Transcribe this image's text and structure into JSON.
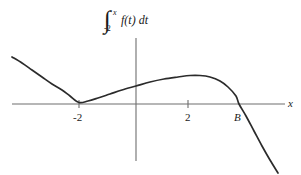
{
  "figure": {
    "title_expression": "integral from -2 to x of f(t) dt",
    "background_color": "#ffffff",
    "curve_color": "#2b2b2b",
    "axis_color": "#6e6e6e"
  },
  "title": {
    "integral_sign": "∫",
    "upper_limit": "x",
    "lower_limit": "-2",
    "integrand": "f(t)",
    "differential": "dt"
  },
  "axes": {
    "x_axis_label": "x",
    "x_axis_y_pixel": 104,
    "y_axis_x_pixel": 136,
    "ticks": [
      {
        "label": "-2",
        "x_pixel": 79
      },
      {
        "label": "2",
        "x_pixel": 188
      }
    ],
    "marked_points": [
      {
        "label": "B",
        "x_pixel": 239
      }
    ]
  },
  "chart_data": {
    "type": "line",
    "xlabel": "x",
    "ylabel": "",
    "grid": false,
    "legend": null,
    "axis_ranges": {
      "x_pixel_range": [
        12,
        281
      ],
      "y_pixel_range": [
        38,
        175
      ]
    },
    "annotations": [
      {
        "text": "-2",
        "role": "x-tick",
        "x": -2
      },
      {
        "text": "2",
        "role": "x-tick",
        "x": 2
      },
      {
        "text": "B",
        "role": "x-intercept",
        "x": "B"
      },
      {
        "text": "x",
        "role": "axis-label"
      }
    ],
    "features": [
      {
        "kind": "local-minimum",
        "x": -2,
        "y": 0,
        "note": "tangent to x-axis"
      },
      {
        "kind": "local-maximum",
        "x": 2.4,
        "y": 0.55,
        "note": "peak above axis"
      },
      {
        "kind": "x-intercept",
        "x": "B",
        "y": 0,
        "note": "curve crosses axis downward"
      }
    ],
    "points_pixel": [
      [
        12,
        57
      ],
      [
        22,
        63
      ],
      [
        32,
        70
      ],
      [
        42,
        77
      ],
      [
        52,
        84
      ],
      [
        62,
        90
      ],
      [
        70,
        96
      ],
      [
        79,
        102.5
      ],
      [
        88,
        101
      ],
      [
        98,
        98
      ],
      [
        110,
        94
      ],
      [
        122,
        90
      ],
      [
        136,
        86
      ],
      [
        150,
        82
      ],
      [
        164,
        79
      ],
      [
        178,
        77
      ],
      [
        190,
        75.5
      ],
      [
        200,
        75.5
      ],
      [
        210,
        77
      ],
      [
        220,
        81
      ],
      [
        228,
        87
      ],
      [
        236,
        96
      ],
      [
        239,
        104
      ],
      [
        246,
        116
      ],
      [
        254,
        131
      ],
      [
        262,
        146
      ],
      [
        270,
        160
      ],
      [
        278,
        173
      ]
    ]
  }
}
